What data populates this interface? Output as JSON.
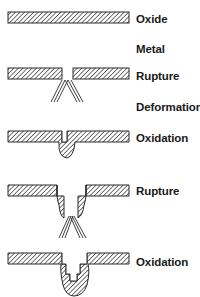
{
  "figure": {
    "stages": [
      {
        "label": "Oxide",
        "top": 12
      },
      {
        "label": "Metal",
        "top": 42
      },
      {
        "label": "Rupture",
        "top": 70
      },
      {
        "label": "Deformation",
        "top": 100
      },
      {
        "label": "Oxidation",
        "top": 132
      },
      {
        "label": "Rupture",
        "top": 184
      },
      {
        "label": "Oxidation",
        "top": 257
      }
    ],
    "colors": {
      "outline": "#2a2a2a",
      "hatch": "#3a3a3a",
      "background": "#ffffff"
    }
  }
}
